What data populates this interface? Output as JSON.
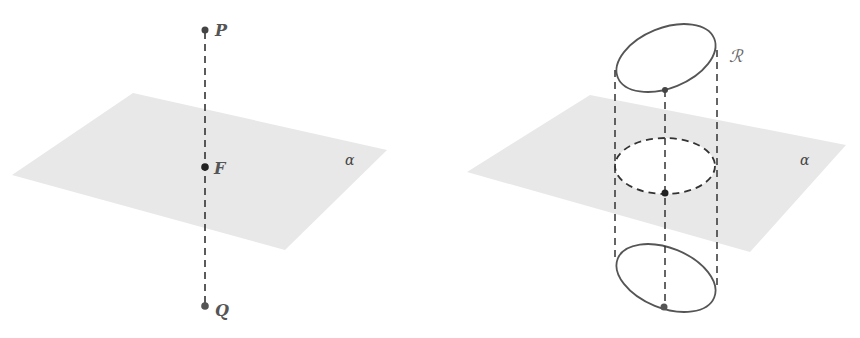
{
  "figures": [
    {
      "id": "left",
      "description": "Line PQ perpendicular to plane alpha, meeting it at F",
      "plane_label": "α",
      "points": [
        {
          "label": "P",
          "role": "top endpoint"
        },
        {
          "label": "F",
          "role": "intersection with plane"
        },
        {
          "label": "Q",
          "role": "bottom endpoint"
        }
      ]
    },
    {
      "id": "right",
      "description": "Cylinder-like construction: region ℛ projected through plane alpha, dashed cross-section in plane",
      "plane_label": "α",
      "region_label": "ℛ"
    }
  ],
  "colors": {
    "plane_fill": "#e8e8e8",
    "line": "#333333",
    "curve": "#555555",
    "point": "#444444"
  }
}
